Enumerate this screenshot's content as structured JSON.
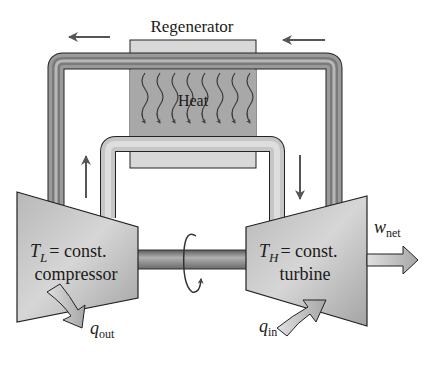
{
  "diagram": {
    "type": "Ericsson cycle schematic with regenerator",
    "regenerator": {
      "label": "Regenerator",
      "heat_label": "Heat",
      "heat_arrow_count": 8
    },
    "compressor": {
      "temp_symbol": "T",
      "temp_subscript": "L",
      "temp_rest": "= const.",
      "name": "compressor"
    },
    "turbine": {
      "temp_symbol": "T",
      "temp_subscript": "H",
      "temp_rest": "= const.",
      "name": "turbine"
    },
    "heat_out": {
      "symbol": "q",
      "subscript": "out"
    },
    "heat_in": {
      "symbol": "q",
      "subscript": "in"
    },
    "work_out": {
      "symbol": "w",
      "subscript": "net"
    },
    "flow_arrows": [
      {
        "position": "top-left",
        "direction": "left"
      },
      {
        "position": "top-right",
        "direction": "left"
      },
      {
        "position": "left-middle",
        "direction": "up"
      },
      {
        "position": "right-middle",
        "direction": "down"
      }
    ],
    "shaft": {
      "rotation_indicator": true
    },
    "colors": {
      "pipe_dark": "#6e6e6e",
      "pipe_light": "#c4c4c4",
      "regenerator_light": "#d8d8d8",
      "regenerator_dark": "#a8a8a8",
      "machine_fill": "#c8c8c8",
      "stroke": "#1a1a1a"
    }
  }
}
